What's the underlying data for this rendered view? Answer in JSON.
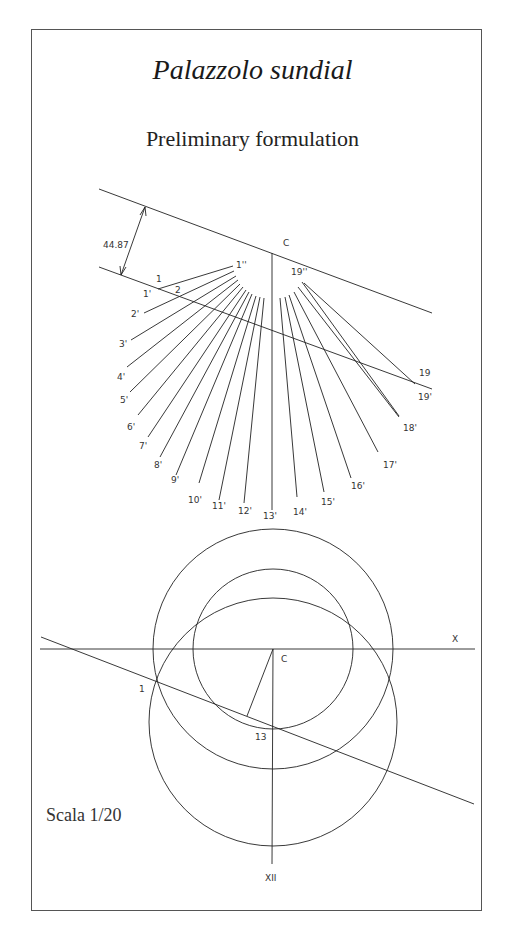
{
  "title": "Palazzolo sundial",
  "subtitle": "Preliminary formulation",
  "scale_label": "Scala 1/20",
  "top_diagram": {
    "dimension_label": "44.87",
    "center_label": "C",
    "point_labels": [
      "1",
      "2",
      "1'",
      "1''",
      "19",
      "19'",
      "19''"
    ],
    "hour_labels_prime": [
      "1'",
      "2'",
      "3'",
      "4'",
      "5'",
      "6'",
      "7'",
      "8'",
      "9'",
      "10'",
      "11'",
      "12'",
      "13'",
      "14'",
      "15'",
      "16'",
      "17'",
      "18'",
      "19'"
    ]
  },
  "bottom_diagram": {
    "center_label": "C",
    "axis_label": "X",
    "point_1_label": "1",
    "point_13_label": "13",
    "noon_label": "XII"
  },
  "colors": {
    "line": "#222222",
    "text": "#333333",
    "background": "#ffffff"
  }
}
